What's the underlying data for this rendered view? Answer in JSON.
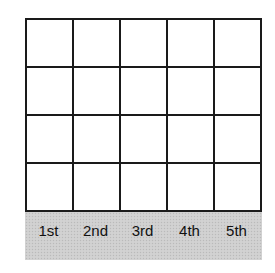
{
  "diagram": {
    "type": "grid",
    "rows": 4,
    "columns": 5,
    "cells_filled": false,
    "column_labels": [
      "1st",
      "2nd",
      "3rd",
      "4th",
      "5th"
    ],
    "colors": {
      "grid_line": "#1a1a1a",
      "cell_fill": "#ffffff",
      "label_band": "#cfcfcf",
      "label_text": "#111111"
    }
  }
}
